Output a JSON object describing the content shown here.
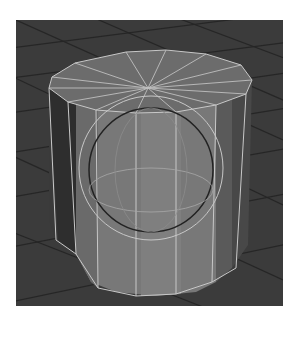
{
  "scene": {
    "description": "3D viewport render of a 12-sided cylinder with an inscribed wireframe sphere on a perspective ground grid",
    "objects": [
      {
        "type": "cylinder",
        "sides": 12,
        "display": "shaded-wireframe"
      },
      {
        "type": "sphere",
        "display": "wireframe-outline"
      }
    ],
    "colors": {
      "background": "#ffffff",
      "viewport": "#3b3b3b",
      "grid_line": "#262626",
      "cylinder_front": "#7a7a7a",
      "cylinder_side_dark": "#3a3a3a",
      "cylinder_side_mid": "#5c5c5c",
      "cylinder_top": "#6e6e6e",
      "wire": "#c8c8c8",
      "sphere_inner": "#2a2a2a"
    }
  }
}
